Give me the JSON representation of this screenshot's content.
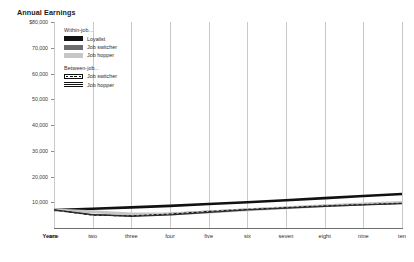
{
  "chart_data": {
    "type": "line",
    "title": "Annual Earnings",
    "xlabel": "Years",
    "ylabel": "",
    "grid": "vertical",
    "legend_position": "upper-left-inside",
    "x": [
      1,
      2,
      3,
      4,
      5,
      6,
      7,
      8,
      9,
      10
    ],
    "categories": [
      "one",
      "two",
      "three",
      "four",
      "five",
      "six",
      "seven",
      "eight",
      "nine",
      "ten"
    ],
    "xlim": [
      1,
      10
    ],
    "ylim": [
      0,
      80000
    ],
    "ytick_labels": [
      "$80,000",
      "70,000",
      "60,000",
      "50,000",
      "40,000",
      "30,000",
      "20,000",
      "10,000"
    ],
    "ytick_values": [
      80000,
      70000,
      60000,
      50000,
      40000,
      30000,
      20000,
      10000
    ],
    "series": [
      {
        "name": "Loyalist",
        "group": "Within-job...",
        "style": "solid",
        "color": "#111111",
        "width": 2.6,
        "values": [
          7000,
          7500,
          8000,
          8600,
          9300,
          10000,
          10800,
          11600,
          12400,
          13200
        ]
      },
      {
        "name": "Job switcher",
        "group": "Within-job...",
        "style": "solid",
        "color": "#6d6d6d",
        "width": 1.5,
        "values": [
          7000,
          5100,
          5000,
          5600,
          6500,
          7300,
          8000,
          8700,
          9200,
          9700
        ]
      },
      {
        "name": "Job hopper",
        "group": "Within-job...",
        "style": "solid",
        "color": "#c6c6c6",
        "width": 3.0,
        "values": [
          7000,
          6300,
          5400,
          5400,
          6200,
          7100,
          7900,
          8600,
          9300,
          9900
        ]
      },
      {
        "name": "Job switcher",
        "group": "Between-job...",
        "style": "dashed",
        "color": "#111111",
        "width": 1.2,
        "values": [
          7000,
          5000,
          4700,
          5400,
          6400,
          7200,
          7900,
          8600,
          9100,
          9600
        ]
      },
      {
        "name": "Job hopper",
        "group": "Between-job...",
        "style": "solid",
        "color": "#2b2b2b",
        "width": 1.2,
        "values": [
          7000,
          5200,
          4500,
          5100,
          6100,
          7000,
          7700,
          8400,
          9000,
          9500
        ]
      }
    ]
  },
  "legend": {
    "groups": [
      {
        "heading": "Within-job...",
        "entries": [
          {
            "label": "Loyalist",
            "swatch": "solid-black"
          },
          {
            "label": "Job switcher",
            "swatch": "dark-gray"
          },
          {
            "label": "Job hopper",
            "swatch": "light-gray"
          }
        ]
      },
      {
        "heading": "Between-job...",
        "entries": [
          {
            "label": "Job switcher",
            "swatch": "dashed"
          },
          {
            "label": "Job hopper",
            "swatch": "striped"
          }
        ]
      }
    ]
  }
}
